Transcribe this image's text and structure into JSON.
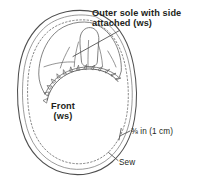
{
  "figure": {
    "background_color": "#ffffff",
    "line_color": "#4a4a4a",
    "text_color": "#231f20"
  },
  "labels": {
    "outer_sole": {
      "line1": "Outer sole with side",
      "line2": "attached (ws)"
    },
    "front": {
      "line1": "Front",
      "line2": "(ws)"
    },
    "seam_allowance": "⅜ in (1 cm)",
    "sew": "Sew"
  },
  "annotations": {
    "leader_outer_sole": "leader-line",
    "leader_seam_allowance": "leader-line",
    "leader_sew": "leader-line"
  },
  "drawing": {
    "front_piece": "shoe-front-sole-outline",
    "stitch_line": "dotted-seam-line",
    "notches": "clipped-seam-allowance-notches",
    "upper": "gathered-toe-upper"
  }
}
